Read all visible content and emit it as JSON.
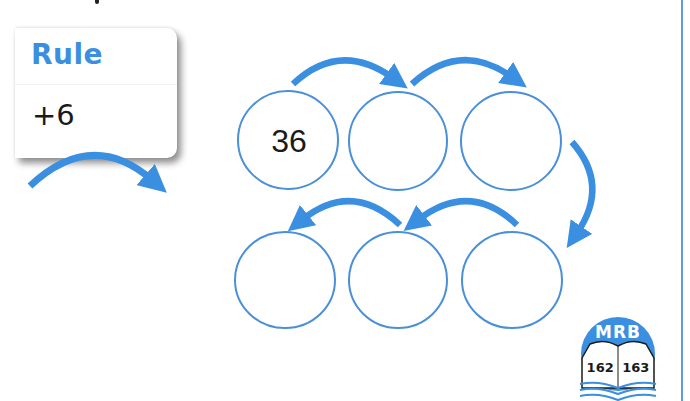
{
  "colors": {
    "accent_blue": "#3b8fe0",
    "circle_stroke": "#4a8fd9",
    "text": "#1a1a1a",
    "page_border": "#5b9de0"
  },
  "rule_card": {
    "title": "Rule",
    "value": "+6"
  },
  "number_chain": {
    "circles": [
      {
        "position": "top-left",
        "value": "36"
      },
      {
        "position": "top-middle",
        "value": ""
      },
      {
        "position": "top-right",
        "value": ""
      },
      {
        "position": "bottom-right",
        "value": ""
      },
      {
        "position": "bottom-middle",
        "value": ""
      },
      {
        "position": "bottom-left",
        "value": ""
      }
    ],
    "arrows": [
      {
        "from": "top-left",
        "to": "top-middle",
        "icon": "curved-arrow-right-icon"
      },
      {
        "from": "top-middle",
        "to": "top-right",
        "icon": "curved-arrow-right-icon"
      },
      {
        "from": "top-right",
        "to": "bottom-right",
        "icon": "curved-arrow-down-icon"
      },
      {
        "from": "bottom-right",
        "to": "bottom-middle",
        "icon": "curved-arrow-left-icon"
      },
      {
        "from": "bottom-middle",
        "to": "bottom-left",
        "icon": "curved-arrow-left-icon"
      }
    ]
  },
  "mrb_badge": {
    "label": "MRB",
    "pages": "162 163",
    "icon": "open-book-icon"
  }
}
